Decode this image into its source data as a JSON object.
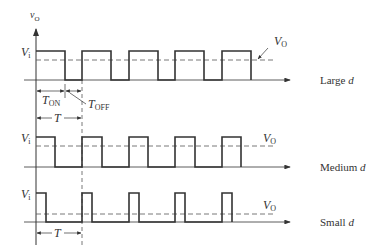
{
  "diagram": {
    "axis_label": {
      "main": "v",
      "sub": "O"
    },
    "colors": {
      "stroke": "#333333",
      "dash": "#555555",
      "background": "#ffffff"
    },
    "panels": [
      {
        "name": "large",
        "vi_label": "V",
        "vi_sub": "i",
        "vo_label": "V",
        "vo_sub": "O",
        "caption_text": "Large ",
        "caption_var": "d"
      },
      {
        "name": "medium",
        "vi_label": "V",
        "vi_sub": "i",
        "vo_label": "V",
        "vo_sub": "O",
        "caption_text": "Medium ",
        "caption_var": "d"
      },
      {
        "name": "small",
        "vi_label": "V",
        "vi_sub": "i",
        "vo_label": "V",
        "vo_sub": "O",
        "caption_text": "Small ",
        "caption_var": "d"
      }
    ],
    "annotations": {
      "t_on": {
        "main": "T",
        "sub": "ON"
      },
      "t_off": {
        "main": "T",
        "sub": "OFF"
      },
      "period_top": "T",
      "period_bottom": "T"
    }
  }
}
